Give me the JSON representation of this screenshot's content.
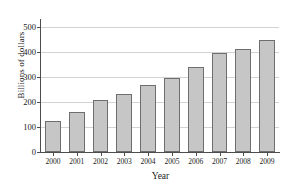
{
  "chart_data": {
    "type": "bar",
    "title": "",
    "subtitle": "",
    "xlabel": "Year",
    "ylabel": "Billions of dollars",
    "categories": [
      "2000",
      "2001",
      "2002",
      "2003",
      "2004",
      "2005",
      "2006",
      "2007",
      "2008",
      "2009"
    ],
    "values": [
      123,
      160,
      207,
      232,
      268,
      295,
      340,
      397,
      412,
      448
    ],
    "ylim": [
      0,
      520
    ],
    "yticks": [
      0,
      100,
      200,
      300,
      400,
      500
    ],
    "ytick_labels": [
      "0",
      "100",
      "200",
      "300",
      "400",
      "500"
    ],
    "grid": true,
    "grid_axis": "y",
    "legend": false,
    "legend_position": "none",
    "bar_color": "#c6c6c6",
    "bar_edge_color": "#6e6e6e",
    "axis_color": "#4d4d4d",
    "grid_color": "#d2d2d2",
    "text_color": "#1a1a1a",
    "background": "#ffffff"
  }
}
